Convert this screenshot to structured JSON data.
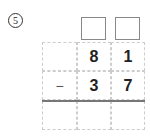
{
  "problem": {
    "number": "5",
    "answer_boxes": [
      "",
      ""
    ],
    "rows": [
      [
        "",
        "8",
        "1"
      ],
      [
        "−",
        "3",
        "7"
      ],
      [
        "",
        "",
        ""
      ]
    ]
  }
}
